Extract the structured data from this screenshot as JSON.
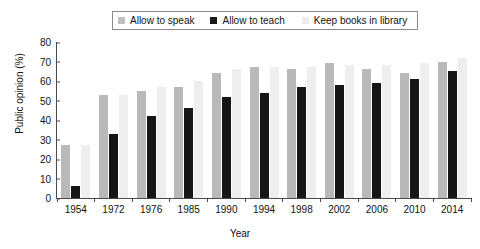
{
  "chart_data": {
    "type": "bar",
    "title": "",
    "xlabel": "Year",
    "ylabel": "Public opinion (%)",
    "ylim": [
      0,
      80
    ],
    "yticks": [
      0,
      10,
      20,
      30,
      40,
      50,
      60,
      70,
      80
    ],
    "grid": false,
    "legend_position": "top-center",
    "categories": [
      "1954",
      "1972",
      "1976",
      "1985",
      "1990",
      "1994",
      "1998",
      "2002",
      "2006",
      "2010",
      "2014"
    ],
    "series": [
      {
        "name": "Allow to speak",
        "color": "#b9b9b9",
        "values": [
          27,
          53,
          55,
          57,
          64,
          67,
          66,
          69,
          66,
          64,
          70
        ]
      },
      {
        "name": "Allow to teach",
        "color": "#161616",
        "values": [
          6,
          33,
          42,
          46,
          52,
          54,
          57,
          58,
          59,
          61,
          65
        ]
      },
      {
        "name": "Keep books in library",
        "color": "#eeeeee",
        "values": [
          27,
          53,
          57,
          60,
          66,
          67,
          67,
          68,
          68,
          69,
          72
        ]
      }
    ]
  },
  "legend": {
    "items": [
      {
        "label": "Allow to speak",
        "swatch": "light-gray-swatch-icon"
      },
      {
        "label": "Allow to teach",
        "swatch": "black-swatch-icon"
      },
      {
        "label": "Keep books in library",
        "swatch": "very-light-gray-swatch-icon"
      }
    ]
  },
  "axes": {
    "y_title": "Public opinion (%)",
    "x_title": "Year",
    "y_ticks": [
      "0",
      "10",
      "20",
      "30",
      "40",
      "50",
      "60",
      "70",
      "80"
    ],
    "x_ticks": [
      "1954",
      "1972",
      "1976",
      "1985",
      "1990",
      "1994",
      "1998",
      "2002",
      "2006",
      "2010",
      "2014"
    ]
  }
}
